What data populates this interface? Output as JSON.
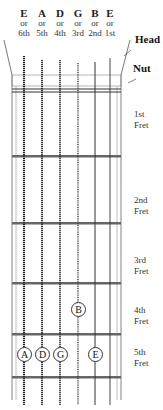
{
  "strings": [
    {
      "note": "E",
      "or": "or",
      "num": "6th",
      "x": 24
    },
    {
      "note": "A",
      "or": "or",
      "num": "5th",
      "x": 42
    },
    {
      "note": "D",
      "or": "or",
      "num": "4th",
      "x": 60
    },
    {
      "note": "G",
      "or": "or",
      "num": "3rd",
      "x": 78
    },
    {
      "note": "B",
      "or": "or",
      "num": "2nd",
      "x": 95
    },
    {
      "note": "E",
      "or": "or",
      "num": "1st",
      "x": 110
    }
  ],
  "labels": {
    "head": "Head",
    "nut": "Nut",
    "frets": [
      {
        "num": "1st",
        "word": "Fret"
      },
      {
        "num": "2nd",
        "word": "Fret"
      },
      {
        "num": "3rd",
        "word": "Fret"
      },
      {
        "num": "4th",
        "word": "Fret"
      },
      {
        "num": "5th",
        "word": "Fret"
      }
    ]
  },
  "markers": [
    {
      "label": "B",
      "string": 5,
      "fret": 4
    },
    {
      "label": "A",
      "string": 2,
      "fret": 5
    },
    {
      "label": "D",
      "string": 3,
      "fret": 5
    },
    {
      "label": "G",
      "string": 4,
      "fret": 5
    },
    {
      "label": "E",
      "string": 1,
      "fret": 5
    }
  ]
}
